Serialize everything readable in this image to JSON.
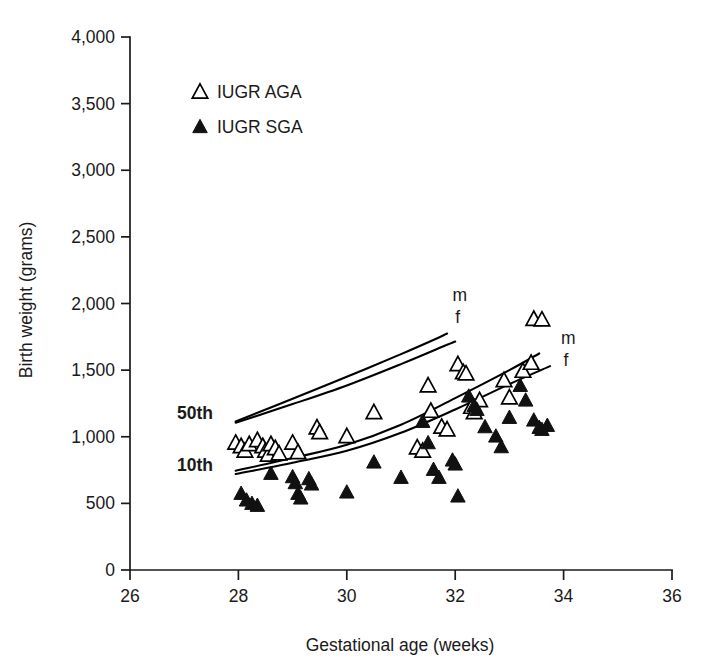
{
  "chart_data": {
    "type": "scatter",
    "title": "",
    "xlabel": "Gestational age (weeks)",
    "ylabel": "Birth weight (grams)",
    "xlim": [
      26,
      36
    ],
    "ylim": [
      0,
      4000
    ],
    "xticks": [
      "26",
      "28",
      "30",
      "32",
      "34",
      "36"
    ],
    "xtick_values": [
      26,
      28,
      30,
      32,
      34,
      36
    ],
    "yticks": [
      "0",
      "500",
      "1,000",
      "1,500",
      "2,000",
      "2,500",
      "3,000",
      "3,500",
      "4,000"
    ],
    "ytick_values": [
      0,
      500,
      1000,
      1500,
      2000,
      2500,
      3000,
      3500,
      4000
    ],
    "grid": false,
    "legend_position": "upper-left-inside",
    "series": [
      {
        "name": "IUGR AGA",
        "marker": "open-triangle",
        "color": "#000000",
        "points": [
          [
            27.95,
            960
          ],
          [
            28.05,
            935
          ],
          [
            28.12,
            900
          ],
          [
            28.2,
            950
          ],
          [
            28.35,
            980
          ],
          [
            28.45,
            935
          ],
          [
            28.5,
            900
          ],
          [
            28.55,
            870
          ],
          [
            28.6,
            950
          ],
          [
            28.68,
            920
          ],
          [
            28.75,
            880
          ],
          [
            29.0,
            960
          ],
          [
            29.1,
            890
          ],
          [
            29.45,
            1075
          ],
          [
            29.5,
            1040
          ],
          [
            30.0,
            1010
          ],
          [
            30.5,
            1190
          ],
          [
            31.3,
            925
          ],
          [
            31.4,
            900
          ],
          [
            31.5,
            1390
          ],
          [
            31.55,
            1200
          ],
          [
            31.75,
            1080
          ],
          [
            31.85,
            1060
          ],
          [
            32.05,
            1550
          ],
          [
            32.15,
            1490
          ],
          [
            32.2,
            1480
          ],
          [
            32.3,
            1230
          ],
          [
            32.35,
            1190
          ],
          [
            32.45,
            1280
          ],
          [
            32.9,
            1430
          ],
          [
            33.0,
            1300
          ],
          [
            33.25,
            1500
          ],
          [
            33.4,
            1560
          ],
          [
            33.45,
            1890
          ],
          [
            33.6,
            1885
          ]
        ]
      },
      {
        "name": "IUGR SGA",
        "marker": "filled-triangle",
        "color": "#111111",
        "points": [
          [
            28.05,
            580
          ],
          [
            28.15,
            530
          ],
          [
            28.25,
            505
          ],
          [
            28.35,
            490
          ],
          [
            28.6,
            730
          ],
          [
            29.0,
            705
          ],
          [
            29.05,
            660
          ],
          [
            29.1,
            580
          ],
          [
            29.15,
            545
          ],
          [
            29.3,
            690
          ],
          [
            29.35,
            650
          ],
          [
            30.0,
            590
          ],
          [
            30.5,
            815
          ],
          [
            31.0,
            700
          ],
          [
            31.4,
            1120
          ],
          [
            31.5,
            960
          ],
          [
            31.6,
            760
          ],
          [
            31.7,
            700
          ],
          [
            31.95,
            830
          ],
          [
            32.0,
            800
          ],
          [
            32.05,
            560
          ],
          [
            32.25,
            1310
          ],
          [
            32.35,
            1240
          ],
          [
            32.4,
            1210
          ],
          [
            32.55,
            1080
          ],
          [
            32.75,
            1010
          ],
          [
            32.85,
            930
          ],
          [
            33.0,
            1150
          ],
          [
            33.2,
            1390
          ],
          [
            33.3,
            1280
          ],
          [
            33.45,
            1130
          ],
          [
            33.55,
            1075
          ],
          [
            33.6,
            1060
          ],
          [
            33.7,
            1090
          ]
        ]
      }
    ],
    "reference_curves": [
      {
        "name": "50th percentile male",
        "label": "m",
        "percentile_label": "50th",
        "label_x": 31.75,
        "label_y": 2055,
        "points": [
          [
            27.95,
            1115
          ],
          [
            29.0,
            1285
          ],
          [
            30.0,
            1450
          ],
          [
            31.0,
            1620
          ],
          [
            31.7,
            1745
          ],
          [
            31.85,
            1775
          ]
        ]
      },
      {
        "name": "50th percentile female",
        "label": "f",
        "points": [
          [
            27.95,
            1105
          ],
          [
            29.0,
            1245
          ],
          [
            30.0,
            1385
          ],
          [
            31.0,
            1545
          ],
          [
            31.85,
            1690
          ],
          [
            32.0,
            1715
          ]
        ]
      },
      {
        "name": "10th percentile male",
        "label": "m",
        "percentile_label": "10th",
        "label_x": 33.95,
        "label_y": 1715,
        "points": [
          [
            27.95,
            745
          ],
          [
            29.0,
            840
          ],
          [
            30.0,
            940
          ],
          [
            31.0,
            1090
          ],
          [
            32.0,
            1290
          ],
          [
            33.0,
            1500
          ],
          [
            33.55,
            1625
          ]
        ]
      },
      {
        "name": "10th percentile female",
        "label": "f",
        "points": [
          [
            27.95,
            720
          ],
          [
            29.0,
            805
          ],
          [
            30.0,
            895
          ],
          [
            31.0,
            1030
          ],
          [
            32.0,
            1205
          ],
          [
            33.0,
            1395
          ],
          [
            33.75,
            1530
          ]
        ]
      }
    ],
    "curve_labels": [
      {
        "text": "m",
        "x": 31.95,
        "y": 2065
      },
      {
        "text": "f",
        "x": 32.0,
        "y": 1900
      },
      {
        "text": "m",
        "x": 33.95,
        "y": 1740
      },
      {
        "text": "f",
        "x": 34.0,
        "y": 1575
      }
    ],
    "percentile_labels": [
      {
        "text": "50th",
        "x": 27.2,
        "y": 1180
      },
      {
        "text": "10th",
        "x": 27.2,
        "y": 790
      }
    ]
  },
  "legend": {
    "items": [
      {
        "label": "IUGR AGA",
        "marker": "open-triangle"
      },
      {
        "label": "IUGR SGA",
        "marker": "filled-triangle"
      }
    ]
  },
  "axes": {
    "x_title": "Gestational age (weeks)",
    "y_title": "Birth weight (grams)"
  }
}
